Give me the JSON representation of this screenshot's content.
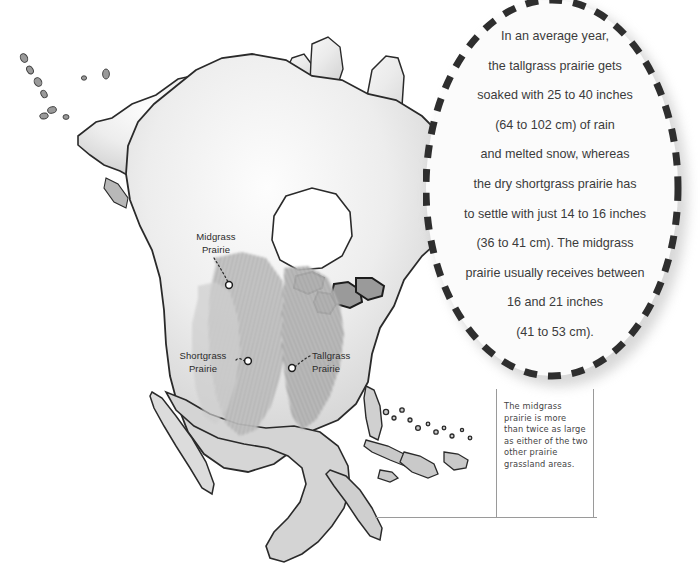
{
  "figure": {
    "kind": "thematic-map"
  },
  "map": {
    "alt": "Grayscale relief map of North America with shaded prairie grassland bands",
    "labels": [
      {
        "id": "midgrass",
        "name": "Midgrass Prairie",
        "line1": "Midgrass",
        "line2": "Prairie",
        "marker_x": 229,
        "marker_y": 285
      },
      {
        "id": "shortgrass",
        "name": "Shortgrass Prairie",
        "line1": "Shortgrass",
        "line2": "Prairie",
        "marker_x": 248,
        "marker_y": 361
      },
      {
        "id": "tallgrass",
        "name": "Tallgrass Prairie",
        "line1": "Tallgrass",
        "line2": "Prairie",
        "marker_x": 292,
        "marker_y": 368
      }
    ]
  },
  "callout": {
    "shape": "dashed-ellipse",
    "lines": [
      "In an average year,",
      "the tallgrass prairie gets",
      "soaked with 25 to 40 inches",
      "(64 to 102 cm) of rain",
      "and melted snow, whereas",
      "the dry shortgrass prairie has",
      "to settle with just 14 to 16 inches",
      "(36 to 41 cm). The midgrass",
      "prairie usually receives between",
      "16 and 21 inches",
      "(41 to 53 cm)."
    ],
    "full_text": "In an average year, the tallgrass prairie gets soaked with 25 to 40 inches (64 to 102 cm) of rain and melted snow, whereas the dry shortgrass prairie has to settle with just 14 to 16 inches (36 to 41 cm). The midgrass prairie usually receives between 16 and 21 inches (41 to 53 cm)."
  },
  "caption": {
    "text": "The midgrass prairie is more than twice as large as either of the two other prairie grassland areas."
  },
  "colors": {
    "background": "#ffffff",
    "callout_fill": "#fbfbfb",
    "callout_dash": "#2e2e2e",
    "text_dark": "#3b3b3b",
    "map_land_light": "#f2f2f2",
    "map_land_mid": "#d8d8d8",
    "map_outline": "#2a2a2a",
    "prairie_shade": "#b4b4b4",
    "caption_border": "#9a9a9a"
  },
  "measurements": {
    "tallgrass_in": "25 to 40 inches",
    "tallgrass_cm": "64 to 102 cm",
    "shortgrass_in": "14 to 16 inches",
    "shortgrass_cm": "36 to 41 cm",
    "midgrass_in": "16 and 21 inches",
    "midgrass_cm": "41 to 53 cm"
  }
}
